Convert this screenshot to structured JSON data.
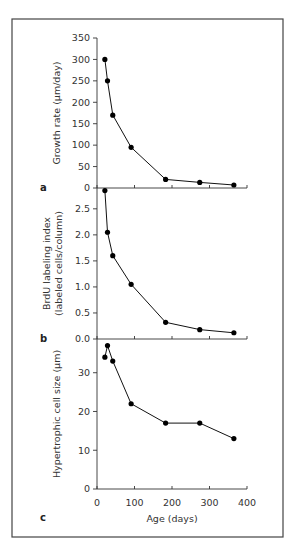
{
  "chart_data": {
    "type": "line",
    "layout": "stacked-panels-shared-x",
    "xlabel": "Age (days)",
    "xlim": [
      0,
      400
    ],
    "xticks": [
      0,
      100,
      200,
      300,
      400
    ],
    "xtick_labels": [
      "0",
      "100",
      "200",
      "300",
      "400"
    ],
    "x": [
      21,
      28,
      42,
      91,
      183,
      274,
      365
    ],
    "grid": false,
    "legend": "none",
    "panels": [
      {
        "letter": "a",
        "ylabel_lines": [
          "Growth rate (µm/day)"
        ],
        "ylim": [
          0,
          350
        ],
        "yticks": [
          0,
          50,
          100,
          150,
          200,
          250,
          300,
          350
        ],
        "ytick_labels": [
          "0",
          "50",
          "100",
          "150",
          "200",
          "250",
          "300",
          "350"
        ],
        "series": [
          {
            "name": "Growth rate",
            "values": [
              300,
              250,
              170,
              95,
              20,
              13,
              7
            ]
          }
        ]
      },
      {
        "letter": "b",
        "ylabel_lines": [
          "BrdU labeling index",
          "(labeled cells/column)"
        ],
        "ylim": [
          0,
          2.9
        ],
        "yticks": [
          0,
          0.5,
          1.0,
          1.5,
          2.0,
          2.5
        ],
        "ytick_labels": [
          "0.0",
          "0.5",
          "1.0",
          "1.5",
          "2.0",
          "2.5"
        ],
        "series": [
          {
            "name": "BrdU labeling index",
            "values": [
              2.85,
              2.05,
              1.6,
              1.05,
              0.32,
              0.18,
              0.12
            ]
          }
        ]
      },
      {
        "letter": "c",
        "ylabel_lines": [
          "Hypertrophic cell size (µm)"
        ],
        "ylim": [
          0,
          38.7
        ],
        "yticks": [
          0,
          10,
          20,
          30
        ],
        "ytick_labels": [
          "0",
          "10",
          "20",
          "30"
        ],
        "series": [
          {
            "name": "Hypertrophic cell size",
            "values": [
              34,
              37,
              33,
              22,
              17,
              17,
              13
            ]
          }
        ]
      }
    ]
  }
}
